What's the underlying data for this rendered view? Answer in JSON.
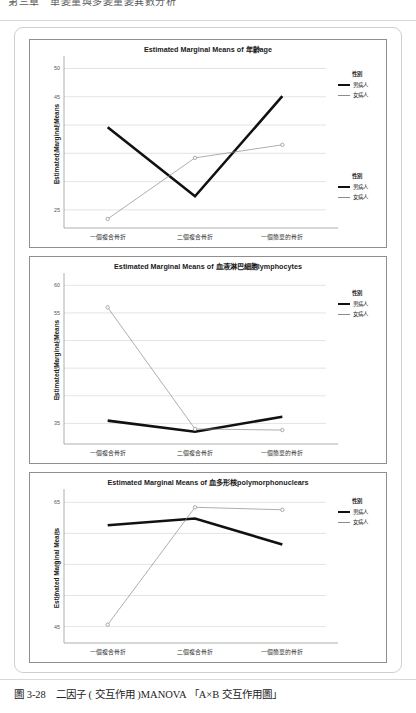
{
  "page": {
    "running_header": "第三章　單變量與多變量變異數分析",
    "caption": "圖 3-28　二因子 ( 交互作用 )MANOVA 「A×B 交互作用圖」"
  },
  "legend": {
    "title": "性別",
    "series": [
      {
        "name": "男病人",
        "style": "bold-black",
        "color": "#111111"
      },
      {
        "name": "女病人",
        "style": "thin-gray",
        "color": "#8b8b8b"
      }
    ]
  },
  "categories": [
    "一個複合骨折",
    "二個複合骨折",
    "一個簡單的骨折"
  ],
  "chart_data": [
    {
      "type": "line",
      "title": "Estimated Marginal Means of 年齡age",
      "xlabel": "",
      "ylabel": "Estimated Marginal Means",
      "categories": [
        "一個複合骨折",
        "二個複合骨折",
        "一個簡單的骨折"
      ],
      "yticks": [
        50,
        45,
        40,
        35,
        30,
        25
      ],
      "ylim": [
        22.5,
        51.5
      ],
      "grid": true,
      "legend_position": "right",
      "series": [
        {
          "name": "男病人",
          "values": [
            39.6,
            27.4,
            45.1
          ],
          "color": "#111111",
          "width": 2.6,
          "markers": false
        },
        {
          "name": "女病人",
          "values": [
            23.4,
            34.2,
            36.5
          ],
          "color": "#8b8b8b",
          "width": 0.7,
          "markers": true
        }
      ]
    },
    {
      "type": "line",
      "title": "Estimated Marginal Means of 血液淋巴細胞lymphocytes",
      "xlabel": "",
      "ylabel": "Estimated Marginal Means",
      "categories": [
        "一個複合骨折",
        "二個複合骨折",
        "一個簡單的骨折"
      ],
      "yticks": [
        60,
        55,
        50,
        45,
        40,
        35
      ],
      "ylim": [
        32.0,
        61.5
      ],
      "grid": true,
      "legend_position": "right",
      "series": [
        {
          "name": "男病人",
          "values": [
            35.5,
            33.5,
            36.2
          ],
          "color": "#111111",
          "width": 2.6,
          "markers": false
        },
        {
          "name": "女病人",
          "values": [
            56.0,
            34.0,
            33.8
          ],
          "color": "#8b8b8b",
          "width": 0.7,
          "markers": true
        }
      ]
    },
    {
      "type": "line",
      "title": "Estimated Marginal Means of 血多形核polymorphonuclears",
      "xlabel": "",
      "ylabel": "Estimated Marginal Means",
      "categories": [
        "一個複合骨折",
        "二個複合骨折",
        "一個簡單的骨折"
      ],
      "yticks": [
        65,
        60,
        55,
        50,
        45
      ],
      "ylim": [
        43.0,
        66.5
      ],
      "grid": true,
      "legend_position": "right",
      "series": [
        {
          "name": "男病人",
          "values": [
            61.3,
            62.4,
            58.2
          ],
          "color": "#111111",
          "width": 2.6,
          "markers": false
        },
        {
          "name": "女病人",
          "values": [
            45.3,
            64.2,
            63.8
          ],
          "color": "#8b8b8b",
          "width": 0.7,
          "markers": true
        }
      ]
    }
  ]
}
